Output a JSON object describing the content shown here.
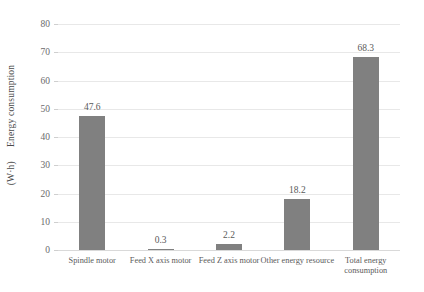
{
  "chart_data": {
    "type": "bar",
    "title": "",
    "xlabel": "",
    "ylabel": "Energy consumption",
    "yunit": "(W·h)",
    "categories": [
      "Spindle motor",
      "Feed X axis motor",
      "Feed Z axis motor",
      "Other energy resource",
      "Total energy consumption"
    ],
    "values": [
      47.6,
      0.3,
      2.2,
      18.2,
      68.3
    ],
    "value_labels": [
      "47.6",
      "0.3",
      "2.2",
      "18.2",
      "68.3"
    ],
    "ylim": [
      0,
      80
    ],
    "yticks": [
      0,
      10,
      20,
      30,
      40,
      50,
      60,
      70,
      80
    ],
    "ytick_labels": [
      "0",
      "10",
      "20",
      "30",
      "40",
      "50",
      "60",
      "70",
      "80"
    ],
    "grid": true,
    "legend": false,
    "bar_color": "#808080",
    "gridline_color": "#e8e8e8",
    "text_color": "#5a5a5a"
  }
}
